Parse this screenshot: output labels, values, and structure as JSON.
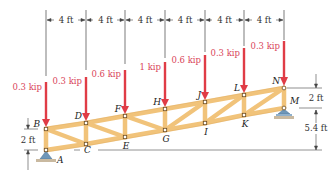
{
  "figure": {
    "type": "planar truss with point loads",
    "colors": {
      "member": "#f1c37a",
      "member_edge": "#d9a04e",
      "load_arrow": "#e03c46",
      "load_text": "#d9455a",
      "dimension_line": "#444444",
      "support": "#6e96b8",
      "ground": "#c9b9a0"
    },
    "top_dimensions": [
      {
        "label": "4 ft"
      },
      {
        "label": "4 ft"
      },
      {
        "label": "4 ft"
      },
      {
        "label": "4 ft"
      },
      {
        "label": "4 ft"
      },
      {
        "label": "4 ft"
      }
    ],
    "loads": [
      {
        "node": "B",
        "label": "0.3 kip"
      },
      {
        "node": "D",
        "label": "0.3 kip"
      },
      {
        "node": "F",
        "label": "0.6 kip"
      },
      {
        "node": "H",
        "label": "1 kip"
      },
      {
        "node": "J",
        "label": "0.6 kip"
      },
      {
        "node": "L",
        "label": "0.3 kip"
      },
      {
        "node": "N",
        "label": "0.3 kip"
      }
    ],
    "nodes": {
      "A": "A",
      "B": "B",
      "C": "C",
      "D": "D",
      "E": "E",
      "F": "F",
      "G": "G",
      "H": "H",
      "I": "I",
      "J": "J",
      "K": "K",
      "L": "L",
      "M": "M",
      "N": "N"
    },
    "left_dimension": {
      "label": "2 ft"
    },
    "right_dimensions": [
      {
        "label": "2 ft"
      },
      {
        "label": "5.4 ft"
      }
    ],
    "supports": [
      {
        "node": "A",
        "type": "pin"
      },
      {
        "node": "M",
        "type": "roller"
      }
    ]
  }
}
